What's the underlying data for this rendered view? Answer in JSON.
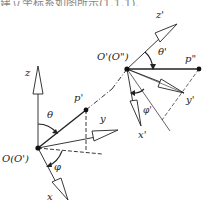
{
  "caption": {
    "text": "建立坐标系如图所示(1.1.1)."
  },
  "diagram": {
    "type": "coordinate-system-transformation",
    "frame_original": {
      "origin_label": "O(O')",
      "axes": {
        "x": "x",
        "y": "y",
        "z": "z"
      },
      "point_label": "p'",
      "angles": {
        "polar": "θ",
        "azimuth": "φ"
      }
    },
    "frame_transformed": {
      "origin_label": "O'(O\")",
      "axes": {
        "x": "x'",
        "y": "y'",
        "z": "z'"
      },
      "point_label": "p\"",
      "angles": {
        "polar": "θ'",
        "azimuth": "φ'"
      }
    },
    "colors": {
      "line": "#222222",
      "background": "#ffffff"
    }
  }
}
